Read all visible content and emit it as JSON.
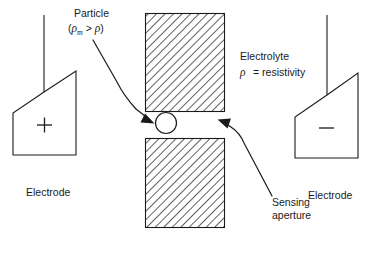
{
  "figure": {
    "type": "coulter-counter-schematic",
    "background_color": "#ffffff",
    "line_color": "#1a1a1a",
    "width": 371,
    "height": 263
  },
  "labels": {
    "particle_title": "Particle",
    "particle_condition_open": "(",
    "particle_condition_rho": "ρ",
    "particle_condition_sub": "m",
    "particle_condition_op": " > ",
    "particle_condition_rho2": "ρ",
    "particle_condition_close": ")",
    "electrolyte_title": "Electrolyte",
    "electrolyte_rho": "ρ",
    "electrolyte_definition": "= resistivity",
    "sensing_line1": "Sensing",
    "sensing_line2": "aperture",
    "electrode_left": "Electrode",
    "electrode_right": "Electrode",
    "positive_sign": "+",
    "negative_sign": "−"
  },
  "elements": {
    "left_electrode": {
      "name": "positive-electrode",
      "polarity": "positive",
      "sign": "+",
      "caption": "Electrode"
    },
    "right_electrode": {
      "name": "negative-electrode",
      "polarity": "negative",
      "sign": "−",
      "caption": "Electrode"
    },
    "upper_wall": {
      "name": "upper-aperture-wall",
      "fill": "hatched"
    },
    "lower_wall": {
      "name": "lower-aperture-wall",
      "fill": "hatched"
    },
    "particle": {
      "name": "particle",
      "shape": "circle",
      "fill": "#ffffff"
    },
    "aperture": {
      "name": "sensing-aperture",
      "caption": "Sensing aperture"
    }
  }
}
